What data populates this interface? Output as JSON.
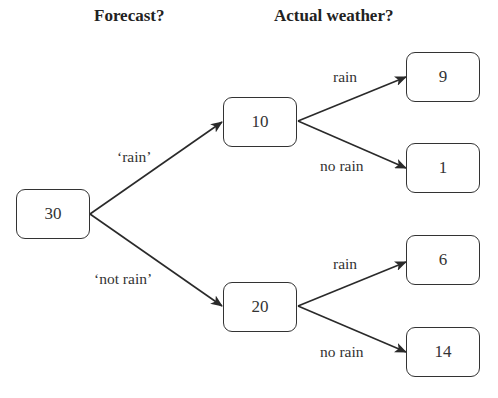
{
  "headers": {
    "forecast": "Forecast?",
    "actual": "Actual weather?"
  },
  "nodes": {
    "root": "30",
    "forecast_rain": "10",
    "forecast_not_rain": "20",
    "fr_rain": "9",
    "fr_no_rain": "1",
    "fnr_rain": "6",
    "fnr_no_rain": "14"
  },
  "edges": {
    "forecast_rain": "‘rain’",
    "forecast_not_rain": "‘not rain’",
    "fr_rain": "rain",
    "fr_no_rain": "no rain",
    "fnr_rain": "rain",
    "fnr_no_rain": "no rain"
  },
  "colors": {
    "stroke": "#333333",
    "background": "#ffffff"
  }
}
